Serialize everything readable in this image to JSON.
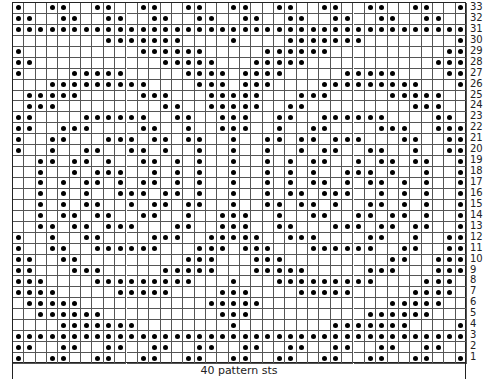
{
  "chart": {
    "columns": 40,
    "rows": 33,
    "footer_label": "40 pattern sts",
    "symbol": "dot = contrast color stitch",
    "row_numbers_side": "right",
    "dot_color": "#000000",
    "grid_color": "#555555",
    "rows_data": [
      {
        "row": 33,
        "dots": [
          1,
          4,
          5,
          8,
          9,
          12,
          13,
          16,
          17,
          20,
          21,
          24,
          25,
          28,
          29,
          32,
          33,
          36,
          37,
          40
        ]
      },
      {
        "row": 32,
        "dots": [
          1,
          2,
          5,
          6,
          9,
          10,
          13,
          14,
          17,
          18,
          21,
          22,
          25,
          26,
          29,
          30,
          33,
          34,
          37,
          38
        ]
      },
      {
        "row": 31,
        "dots": [
          1,
          2,
          3,
          4,
          5,
          6,
          7,
          8,
          9,
          10,
          11,
          12,
          13,
          14,
          15,
          16,
          17,
          18,
          19,
          20,
          21,
          22,
          23,
          24,
          25,
          26,
          27,
          28,
          29,
          30,
          31,
          32,
          33,
          34,
          35,
          36,
          37,
          38,
          39,
          40
        ]
      },
      {
        "row": 30,
        "dots": [
          9,
          10,
          11,
          12,
          13,
          14,
          15,
          20,
          25,
          26,
          27,
          28,
          29,
          30,
          31,
          40
        ]
      },
      {
        "row": 29,
        "dots": [
          1,
          12,
          13,
          14,
          15,
          16,
          17,
          23,
          24,
          25,
          26,
          27,
          28,
          39,
          40
        ]
      },
      {
        "row": 28,
        "dots": [
          1,
          2,
          14,
          15,
          16,
          17,
          18,
          22,
          23,
          24,
          25,
          26,
          38,
          39,
          40
        ]
      },
      {
        "row": 27,
        "dots": [
          1,
          6,
          7,
          8,
          9,
          10,
          16,
          17,
          18,
          19,
          21,
          22,
          23,
          24,
          30,
          31,
          32,
          33,
          34,
          39,
          40
        ]
      },
      {
        "row": 26,
        "dots": [
          4,
          5,
          6,
          7,
          8,
          9,
          10,
          11,
          12,
          17,
          18,
          19,
          21,
          22,
          23,
          28,
          29,
          30,
          31,
          32,
          33,
          34,
          35,
          36,
          40
        ]
      },
      {
        "row": 25,
        "dots": [
          2,
          3,
          4,
          5,
          6,
          12,
          13,
          14,
          18,
          19,
          20,
          21,
          22,
          26,
          27,
          28,
          34,
          35,
          36,
          37,
          38
        ]
      },
      {
        "row": 24,
        "dots": [
          2,
          3,
          4,
          14,
          15,
          18,
          19,
          20,
          21,
          22,
          25,
          26,
          36,
          37,
          38
        ]
      },
      {
        "row": 23,
        "dots": [
          1,
          2,
          7,
          8,
          9,
          10,
          11,
          12,
          15,
          16,
          19,
          20,
          21,
          24,
          25,
          28,
          29,
          30,
          31,
          32,
          33,
          38,
          39
        ]
      },
      {
        "row": 22,
        "dots": [
          1,
          2,
          5,
          6,
          7,
          12,
          13,
          16,
          19,
          20,
          21,
          24,
          27,
          28,
          33,
          34,
          35,
          38,
          39,
          40
        ]
      },
      {
        "row": 21,
        "dots": [
          1,
          4,
          5,
          9,
          10,
          11,
          13,
          14,
          16,
          17,
          20,
          23,
          24,
          26,
          27,
          29,
          30,
          31,
          35,
          36,
          39,
          40
        ]
      },
      {
        "row": 20,
        "dots": [
          1,
          4,
          7,
          8,
          11,
          12,
          14,
          17,
          20,
          23,
          26,
          28,
          29,
          32,
          33,
          36,
          39,
          40
        ]
      },
      {
        "row": 19,
        "dots": [
          3,
          4,
          6,
          7,
          9,
          12,
          13,
          15,
          17,
          20,
          23,
          25,
          27,
          28,
          31,
          33,
          34,
          36,
          37,
          40
        ]
      },
      {
        "row": 18,
        "dots": [
          3,
          6,
          8,
          9,
          10,
          13,
          15,
          17,
          20,
          23,
          25,
          27,
          30,
          31,
          32,
          34,
          37,
          40
        ]
      },
      {
        "row": 17,
        "dots": [
          3,
          5,
          7,
          8,
          10,
          12,
          13,
          15,
          17,
          20,
          23,
          25,
          27,
          28,
          30,
          32,
          33,
          35,
          37,
          40
        ]
      },
      {
        "row": 16,
        "dots": [
          3,
          5,
          7,
          10,
          11,
          12,
          14,
          15,
          17,
          20,
          23,
          25,
          26,
          28,
          29,
          30,
          33,
          35,
          37,
          40
        ]
      },
      {
        "row": 15,
        "dots": [
          3,
          5,
          7,
          8,
          11,
          13,
          14,
          16,
          17,
          20,
          23,
          24,
          26,
          27,
          29,
          32,
          33,
          35,
          37,
          40
        ]
      },
      {
        "row": 14,
        "dots": [
          3,
          5,
          6,
          8,
          9,
          12,
          13,
          16,
          19,
          20,
          21,
          24,
          27,
          28,
          31,
          32,
          34,
          35,
          37,
          40
        ]
      },
      {
        "row": 13,
        "dots": [
          3,
          4,
          6,
          7,
          9,
          10,
          11,
          15,
          16,
          19,
          20,
          21,
          24,
          25,
          29,
          30,
          31,
          33,
          34,
          36,
          37,
          40
        ]
      },
      {
        "row": 12,
        "dots": [
          1,
          4,
          7,
          8,
          13,
          14,
          15,
          18,
          19,
          20,
          21,
          22,
          25,
          26,
          27,
          32,
          33,
          36,
          39,
          40
        ]
      },
      {
        "row": 11,
        "dots": [
          1,
          4,
          5,
          8,
          9,
          10,
          11,
          12,
          13,
          17,
          18,
          19,
          21,
          22,
          23,
          27,
          28,
          29,
          30,
          31,
          32,
          35,
          36,
          39,
          40
        ]
      },
      {
        "row": 10,
        "dots": [
          1,
          2,
          5,
          6,
          16,
          17,
          18,
          22,
          23,
          24,
          34,
          35,
          38,
          39,
          40
        ]
      },
      {
        "row": 9,
        "dots": [
          1,
          2,
          6,
          7,
          8,
          14,
          15,
          16,
          17,
          18,
          22,
          23,
          24,
          25,
          26,
          32,
          33,
          34,
          38,
          39,
          40
        ]
      },
      {
        "row": 8,
        "dots": [
          1,
          2,
          3,
          8,
          9,
          10,
          11,
          12,
          13,
          14,
          15,
          16,
          20,
          24,
          25,
          26,
          27,
          28,
          29,
          30,
          31,
          32,
          37,
          38,
          39
        ]
      },
      {
        "row": 7,
        "dots": [
          1,
          2,
          3,
          4,
          10,
          11,
          12,
          13,
          14,
          19,
          20,
          21,
          26,
          27,
          28,
          29,
          30,
          36,
          37,
          38,
          39
        ]
      },
      {
        "row": 6,
        "dots": [
          2,
          3,
          4,
          5,
          6,
          18,
          19,
          20,
          21,
          22,
          34,
          35,
          36,
          37,
          38
        ]
      },
      {
        "row": 5,
        "dots": [
          3,
          4,
          5,
          6,
          7,
          8,
          19,
          20,
          21,
          32,
          33,
          34,
          35,
          36,
          37
        ]
      },
      {
        "row": 4,
        "dots": [
          5,
          6,
          7,
          8,
          9,
          10,
          11,
          20,
          29,
          30,
          31,
          32,
          33,
          34,
          35,
          40
        ]
      },
      {
        "row": 3,
        "dots": [
          1,
          2,
          3,
          4,
          5,
          6,
          7,
          8,
          9,
          10,
          11,
          12,
          13,
          14,
          15,
          16,
          17,
          18,
          19,
          20,
          21,
          22,
          23,
          24,
          25,
          26,
          27,
          28,
          29,
          30,
          31,
          32,
          33,
          34,
          35,
          36,
          37,
          38,
          39,
          40
        ]
      },
      {
        "row": 2,
        "dots": [
          1,
          2,
          5,
          6,
          9,
          10,
          13,
          14,
          17,
          18,
          21,
          22,
          25,
          26,
          29,
          30,
          33,
          34,
          37,
          38
        ]
      },
      {
        "row": 1,
        "dots": [
          1,
          4,
          5,
          8,
          9,
          12,
          13,
          16,
          17,
          20,
          21,
          24,
          25,
          28,
          29,
          32,
          33,
          36,
          37,
          40
        ]
      }
    ]
  }
}
